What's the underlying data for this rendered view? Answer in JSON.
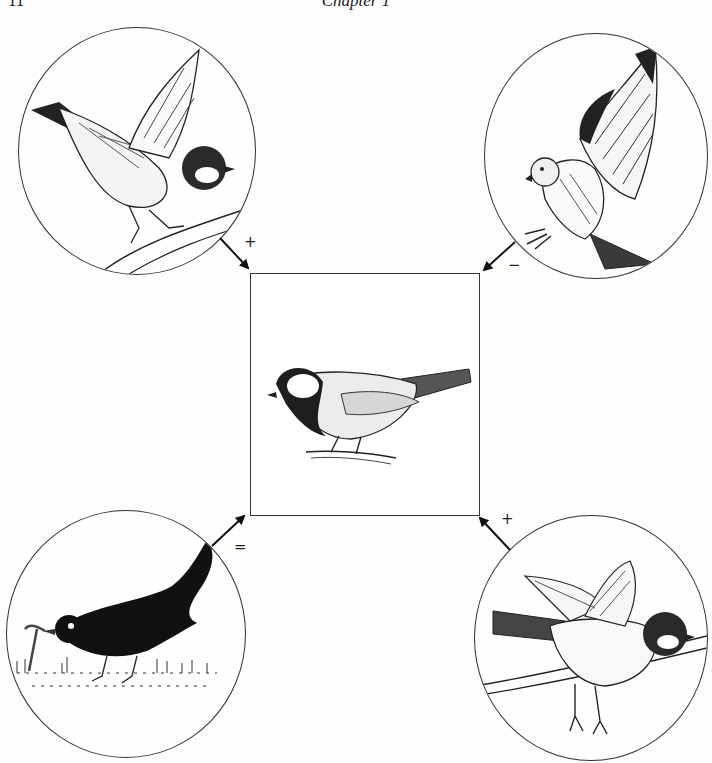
{
  "header": {
    "page_number": "11",
    "chapter_title": "Chapter 1"
  },
  "diagram": {
    "center": {
      "label": "Great tit (focal organism)",
      "icon": "great-tit-perched-icon"
    },
    "interactions": [
      {
        "position": "top-left",
        "sign": "+",
        "label": "Great tit (mate)",
        "icon": "great-tit-flying-icon",
        "arrow_direction": "toward-center"
      },
      {
        "position": "top-right",
        "sign": "−",
        "label": "Sparrowhawk (predator)",
        "icon": "hawk-icon",
        "arrow_direction": "toward-center"
      },
      {
        "position": "bottom-left",
        "sign": "=",
        "label": "Blackbird with worm (competitor)",
        "icon": "blackbird-icon",
        "arrow_direction": "toward-center"
      },
      {
        "position": "bottom-right",
        "sign": "+",
        "label": "Great tit (landing)",
        "icon": "great-tit-landing-icon",
        "arrow_direction": "toward-center"
      }
    ],
    "colors": {
      "line": "#1a1a1a",
      "background": "#fdfdfc"
    }
  }
}
